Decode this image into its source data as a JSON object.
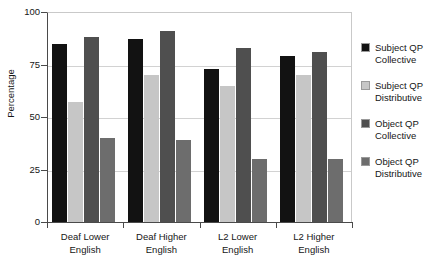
{
  "chart_data": {
    "type": "bar",
    "title": "",
    "xlabel": "",
    "ylabel": "Percentage",
    "ylim": [
      0,
      100
    ],
    "yticks": [
      0,
      25,
      50,
      75,
      100
    ],
    "ytick_labels": [
      "0",
      "25",
      "50",
      "75",
      "100"
    ],
    "grid": true,
    "legend_position": "right",
    "categories": [
      "Deaf Lower\nEnglish",
      "Deaf Higher\nEnglish",
      "L2 Lower\nEnglish",
      "L2 Higher\nEnglish"
    ],
    "series": [
      {
        "name": "Subject QP\nCollective",
        "color": "#121212",
        "values": [
          85,
          87,
          73,
          79
        ]
      },
      {
        "name": "Subject QP\nDistributive",
        "color": "#c6c6c6",
        "values": [
          57,
          70,
          65,
          70
        ]
      },
      {
        "name": "Object QP\nCollective",
        "color": "#4f4f4f",
        "values": [
          88,
          91,
          83,
          81
        ]
      },
      {
        "name": "Object QP\nDistributive",
        "color": "#6d6d6d",
        "values": [
          40,
          39,
          30,
          30
        ]
      }
    ]
  }
}
